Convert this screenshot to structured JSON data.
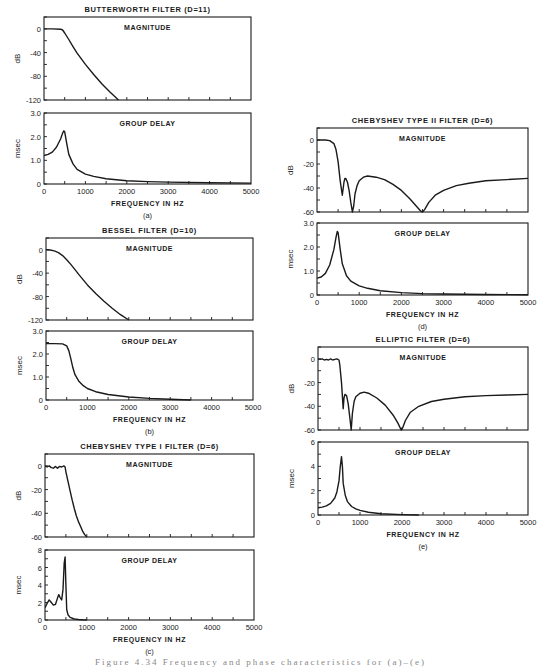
{
  "figure": {
    "caption_partial": "Figure 4.34  Frequency and phase characteristics for (a)–(e)"
  },
  "colors": {
    "ink": "#1a1a1a",
    "paper": "#ffffff"
  },
  "chart_data": [
    {
      "id": "a",
      "label": "(a)",
      "title": "BUTTERWORTH FILTER (D=11)",
      "xlabel": "FREQUENCY IN HZ",
      "xlim": [
        0,
        5000
      ],
      "xticks": [
        0,
        1000,
        2000,
        3000,
        4000,
        5000
      ],
      "panels": [
        {
          "type": "line",
          "name": "MAGNITUDE",
          "ylabel": "dB",
          "ylim": [
            -120,
            20
          ],
          "yticks": [
            0,
            -40,
            -80,
            -120
          ],
          "frame": {
            "x": 44,
            "y": 17,
            "w": 207,
            "h": 83
          },
          "x": [
            0,
            200,
            400,
            450,
            500,
            600,
            700,
            800,
            1000,
            1200,
            1400,
            1600,
            1800
          ],
          "y": [
            0,
            0,
            -0.5,
            -2,
            -7,
            -18,
            -30,
            -41,
            -60,
            -77,
            -93,
            -107,
            -120
          ]
        },
        {
          "type": "line",
          "name": "GROUP DELAY",
          "ylabel": "msec",
          "ylim": [
            0,
            3.0
          ],
          "yticks": [
            0,
            1.0,
            2.0,
            3.0
          ],
          "ytick_labels": [
            "0",
            "1.0",
            "2.0",
            "3.0"
          ],
          "frame": {
            "x": 44,
            "y": 113,
            "w": 207,
            "h": 71
          },
          "x": [
            0,
            100,
            200,
            300,
            400,
            450,
            480,
            500,
            550,
            600,
            700,
            800,
            1000,
            1200,
            1500,
            2000,
            2500,
            3000,
            4000,
            5000
          ],
          "y": [
            1.2,
            1.25,
            1.35,
            1.55,
            1.9,
            2.15,
            2.25,
            2.2,
            1.7,
            1.25,
            0.85,
            0.62,
            0.42,
            0.32,
            0.22,
            0.14,
            0.1,
            0.08,
            0.05,
            0.04
          ]
        }
      ]
    },
    {
      "id": "b",
      "label": "(b)",
      "title": "BESSEL FILTER (D=10)",
      "xlabel": "FREQUENCY IN HZ",
      "xlim": [
        0,
        5000
      ],
      "xticks": [
        0,
        1000,
        2000,
        3000,
        4000,
        5000
      ],
      "panels": [
        {
          "type": "line",
          "name": "MAGNITUDE",
          "ylabel": "dB",
          "ylim": [
            -120,
            20
          ],
          "yticks": [
            0,
            -40,
            -80,
            -120
          ],
          "frame": {
            "x": 46,
            "y": 238,
            "w": 207,
            "h": 82
          },
          "x": [
            0,
            100,
            200,
            300,
            400,
            500,
            600,
            700,
            800,
            1000,
            1200,
            1400,
            1600,
            1800,
            2000
          ],
          "y": [
            0,
            -0.5,
            -2,
            -5,
            -10,
            -17,
            -25,
            -34,
            -43,
            -60,
            -75,
            -88,
            -100,
            -111,
            -120
          ]
        },
        {
          "type": "line",
          "name": "GROUP DELAY",
          "ylabel": "msec",
          "ylim": [
            0,
            3.0
          ],
          "yticks": [
            0,
            1.0,
            2.0,
            3.0
          ],
          "ytick_labels": [
            "0",
            "1.0",
            "2.0",
            "3.0"
          ],
          "frame": {
            "x": 46,
            "y": 331,
            "w": 207,
            "h": 69
          },
          "x": [
            0,
            200,
            400,
            500,
            550,
            600,
            650,
            700,
            800,
            900,
            1000,
            1200,
            1500,
            2000,
            2500,
            3000,
            3500
          ],
          "y": [
            2.45,
            2.45,
            2.44,
            2.35,
            2.15,
            1.8,
            1.4,
            1.1,
            0.8,
            0.62,
            0.5,
            0.36,
            0.24,
            0.13,
            0.07,
            0.03,
            0.0
          ]
        }
      ]
    },
    {
      "id": "c",
      "label": "(c)",
      "title": "CHEBYSHEV TYPE I FILTER (D=6)",
      "xlabel": "FREQUENCY IN HZ",
      "xlim": [
        0,
        5000
      ],
      "xticks": [
        0,
        1000,
        2000,
        3000,
        4000,
        5000
      ],
      "panels": [
        {
          "type": "line",
          "name": "MAGNITUDE",
          "ylabel": "dB",
          "ylim": [
            -60,
            10
          ],
          "yticks": [
            0,
            -20,
            -40,
            -60
          ],
          "ytick_labels": [
            "0",
            "-20",
            "-40",
            "-60"
          ],
          "frame": {
            "x": 45,
            "y": 454,
            "w": 209,
            "h": 83
          },
          "x": [
            0,
            50,
            100,
            150,
            200,
            250,
            300,
            350,
            400,
            450,
            480,
            500,
            550,
            600,
            650,
            700,
            750,
            800,
            850,
            900,
            950,
            1000
          ],
          "y": [
            0,
            -1,
            0,
            -1.5,
            -2,
            -0.5,
            -2,
            -0.5,
            -1,
            0,
            -1,
            -5,
            -13,
            -21,
            -29,
            -36,
            -42,
            -47,
            -51,
            -55,
            -58,
            -60
          ]
        },
        {
          "type": "line",
          "name": "GROUP DELAY",
          "ylabel": "msec",
          "ylim": [
            0,
            8
          ],
          "yticks": [
            0,
            2,
            4,
            6,
            8
          ],
          "ytick_labels": [
            "0",
            "2",
            "4",
            "6",
            "8"
          ],
          "frame": {
            "x": 45,
            "y": 550,
            "w": 209,
            "h": 70
          },
          "x": [
            0,
            50,
            100,
            150,
            200,
            250,
            300,
            330,
            360,
            400,
            430,
            460,
            480,
            500,
            520,
            550,
            600,
            700,
            800,
            900,
            1000
          ],
          "y": [
            1.4,
            1.9,
            2.3,
            2.0,
            1.7,
            1.8,
            2.5,
            2.9,
            2.6,
            2.3,
            3.5,
            6.5,
            7.2,
            4.0,
            1.2,
            0.6,
            0.3,
            0.12,
            0.06,
            0.02,
            0.0
          ]
        }
      ]
    },
    {
      "id": "d",
      "label": "(d)",
      "title": "CHEBYSHEV TYPE II FILTER (D=6)",
      "xlabel": "FREQUENCY IN HZ",
      "xlim": [
        0,
        5000
      ],
      "xticks": [
        0,
        1000,
        2000,
        3000,
        4000,
        5000
      ],
      "panels": [
        {
          "type": "line",
          "name": "MAGNITUDE",
          "ylabel": "dB",
          "ylim": [
            -60,
            10
          ],
          "yticks": [
            0,
            -20,
            -40,
            -60
          ],
          "ytick_labels": [
            "0",
            "-20",
            "-40",
            "-60"
          ],
          "frame": {
            "x": 317,
            "y": 128,
            "w": 211,
            "h": 84
          },
          "x": [
            0,
            200,
            300,
            400,
            450,
            500,
            550,
            600,
            640,
            660,
            680,
            720,
            760,
            800,
            840,
            870,
            900,
            950,
            1000,
            1100,
            1200,
            1400,
            1600,
            1800,
            2000,
            2200,
            2350,
            2450,
            2500,
            2550,
            2650,
            2800,
            3000,
            3300,
            3600,
            4000,
            4500,
            5000
          ],
          "y": [
            0,
            0,
            -0.5,
            -3,
            -8,
            -18,
            -34,
            -46,
            -35,
            -32,
            -32,
            -35,
            -42,
            -52,
            -60,
            -55,
            -45,
            -38,
            -34,
            -31,
            -30,
            -31,
            -33,
            -37,
            -42,
            -49,
            -55,
            -59,
            -60,
            -58,
            -52,
            -46,
            -42,
            -38,
            -36,
            -34,
            -33,
            -32
          ]
        },
        {
          "type": "line",
          "name": "GROUP DELAY",
          "ylabel": "msec",
          "ylim": [
            0,
            3.0
          ],
          "yticks": [
            0,
            1.0,
            2.0,
            3.0
          ],
          "ytick_labels": [
            "0",
            "1.0",
            "2.0",
            "3.0"
          ],
          "frame": {
            "x": 317,
            "y": 223,
            "w": 211,
            "h": 72
          },
          "x": [
            0,
            100,
            200,
            300,
            400,
            450,
            480,
            500,
            550,
            600,
            700,
            800,
            1000,
            1200,
            1500,
            2000,
            2500,
            3000,
            4000,
            5000
          ],
          "y": [
            0.7,
            0.75,
            0.9,
            1.25,
            1.9,
            2.4,
            2.65,
            2.6,
            1.9,
            1.3,
            0.8,
            0.58,
            0.38,
            0.28,
            0.18,
            0.1,
            0.06,
            0.04,
            0.02,
            0.01
          ]
        }
      ]
    },
    {
      "id": "e",
      "label": "(e)",
      "title": "ELLIPTIC FILTER (D=6)",
      "xlabel": "FREQUENCY IN HZ",
      "xlim": [
        0,
        5000
      ],
      "xticks": [
        0,
        1000,
        2000,
        3000,
        4000,
        5000
      ],
      "panels": [
        {
          "type": "line",
          "name": "MAGNITUDE",
          "ylabel": "dB",
          "ylim": [
            -60,
            10
          ],
          "yticks": [
            0,
            -20,
            -40,
            -60
          ],
          "ytick_labels": [
            "0",
            "-20",
            "-40",
            "-60"
          ],
          "frame": {
            "x": 318,
            "y": 347,
            "w": 210,
            "h": 83
          },
          "x": [
            0,
            50,
            100,
            150,
            200,
            250,
            300,
            350,
            400,
            450,
            500,
            520,
            560,
            600,
            620,
            640,
            680,
            720,
            760,
            790,
            820,
            860,
            900,
            1000,
            1100,
            1200,
            1400,
            1600,
            1800,
            1900,
            1980,
            2020,
            2080,
            2200,
            2400,
            2700,
            3000,
            3500,
            4000,
            4500,
            5000
          ],
          "y": [
            0,
            -0.5,
            0,
            -1,
            -0.5,
            -1,
            0,
            -1,
            -0.5,
            0,
            -1,
            -5,
            -20,
            -42,
            -33,
            -30,
            -31,
            -38,
            -50,
            -60,
            -46,
            -36,
            -32,
            -29,
            -28,
            -29,
            -33,
            -39,
            -48,
            -54,
            -60,
            -58,
            -52,
            -45,
            -40,
            -36,
            -34,
            -32,
            -31,
            -30.5,
            -30
          ]
        },
        {
          "type": "line",
          "name": "GROUP DELAY",
          "ylabel": "msec",
          "ylim": [
            0,
            6
          ],
          "yticks": [
            0,
            2,
            4,
            6
          ],
          "ytick_labels": [
            "0",
            "2",
            "4",
            "6"
          ],
          "frame": {
            "x": 318,
            "y": 442,
            "w": 210,
            "h": 73
          },
          "x": [
            0,
            100,
            200,
            300,
            400,
            450,
            500,
            530,
            560,
            580,
            600,
            650,
            700,
            800,
            900,
            1000,
            1200,
            1500,
            2000,
            2400
          ],
          "y": [
            0.6,
            0.65,
            0.75,
            0.95,
            1.4,
            1.9,
            2.8,
            4.0,
            4.8,
            4.0,
            2.6,
            1.6,
            1.1,
            0.7,
            0.5,
            0.38,
            0.22,
            0.1,
            0.03,
            0.0
          ]
        }
      ]
    }
  ]
}
